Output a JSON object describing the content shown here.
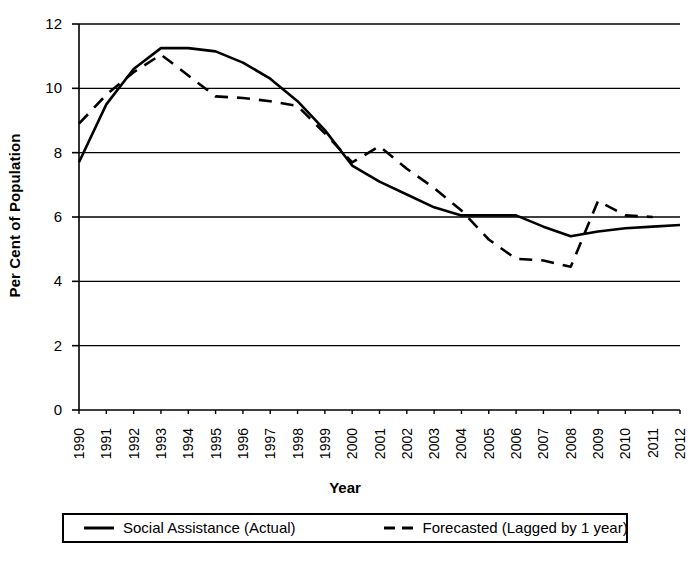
{
  "chart_data": {
    "type": "line",
    "title": "",
    "xlabel": "Year",
    "ylabel": "Per Cent of Population",
    "x": [
      1990,
      1991,
      1992,
      1993,
      1994,
      1995,
      1996,
      1997,
      1998,
      1999,
      2000,
      2001,
      2002,
      2003,
      2004,
      2005,
      2006,
      2007,
      2008,
      2009,
      2010,
      2011,
      2012
    ],
    "categories": [
      "1990",
      "1991",
      "1992",
      "1993",
      "1994",
      "1995",
      "1996",
      "1997",
      "1998",
      "1999",
      "2000",
      "2001",
      "2002",
      "2003",
      "2004",
      "2005",
      "2006",
      "2007",
      "2008",
      "2009",
      "2010",
      "2011",
      "2012"
    ],
    "xlim": [
      1990,
      2012
    ],
    "ylim": [
      0,
      12
    ],
    "yticks": [
      0,
      2,
      4,
      6,
      8,
      10,
      12
    ],
    "ytick_labels": [
      "0",
      "2",
      "4",
      "6",
      "8",
      "10",
      "12"
    ],
    "grid": "horizontal",
    "legend_position": "below-plot",
    "series": [
      {
        "name": "Social Assistance (Actual)",
        "style": "solid",
        "color": "#000000",
        "values": [
          7.7,
          9.5,
          10.6,
          11.25,
          11.25,
          11.15,
          10.8,
          10.3,
          9.6,
          8.7,
          7.6,
          7.1,
          6.7,
          6.3,
          6.05,
          6.05,
          6.05,
          5.7,
          5.4,
          5.55,
          5.65,
          5.7,
          5.75
        ]
      },
      {
        "name": "Forecasted (Lagged by 1 year)",
        "style": "dashed",
        "color": "#000000",
        "values": [
          8.9,
          9.8,
          10.5,
          11.05,
          10.4,
          9.75,
          9.7,
          9.6,
          9.45,
          8.6,
          7.7,
          8.2,
          7.5,
          6.9,
          6.2,
          5.3,
          4.7,
          4.65,
          4.45,
          6.5,
          6.05,
          6.0,
          null
        ]
      }
    ]
  },
  "axes": {
    "y_title": "Per Cent of Population",
    "x_title": "Year"
  },
  "legend": {
    "entries": [
      {
        "label": "Social Assistance (Actual)",
        "style": "solid"
      },
      {
        "label": "Forecasted (Lagged by 1 year)",
        "style": "dashed"
      }
    ]
  },
  "colors": {
    "line": "#000000",
    "grid": "#000000",
    "background": "#ffffff"
  }
}
